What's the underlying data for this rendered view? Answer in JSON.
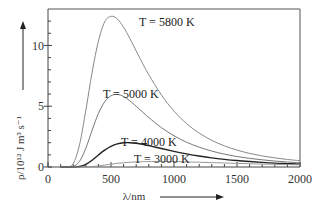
{
  "chart_data": {
    "type": "line",
    "title": "",
    "xlabel": "λ/nm",
    "ylabel": "ρ/10¹² J m³ s⁻¹",
    "xlim": [
      0,
      2000
    ],
    "ylim": [
      0,
      13
    ],
    "x_ticks": [
      0,
      500,
      1000,
      1500,
      2000
    ],
    "y_ticks": [
      0,
      5,
      10
    ],
    "grid": false,
    "legend": "inline labels",
    "x": [
      100,
      150,
      200,
      250,
      300,
      350,
      400,
      450,
      500,
      550,
      600,
      650,
      700,
      750,
      800,
      900,
      1000,
      1100,
      1200,
      1300,
      1400,
      1500,
      1600,
      1700,
      1800,
      1900,
      2000
    ],
    "series": [
      {
        "name": "T = 5800 K",
        "label": "T = 5800 K",
        "color": "#888888",
        "values": [
          0.0,
          0.0,
          0.28,
          1.82,
          4.65,
          7.79,
          10.35,
          11.94,
          12.4,
          12.18,
          11.5,
          10.57,
          9.55,
          8.54,
          7.59,
          5.93,
          4.6,
          3.57,
          2.79,
          2.19,
          1.74,
          1.39,
          1.12,
          0.91,
          0.75,
          0.62,
          0.52
        ]
      },
      {
        "name": "T = 5000 K",
        "label": "T = 5000 K",
        "color": "#777777",
        "values": [
          0.0,
          0.0,
          0.05,
          0.46,
          1.54,
          3.02,
          4.4,
          5.36,
          5.86,
          5.97,
          5.8,
          5.44,
          5.0,
          4.53,
          4.07,
          3.24,
          2.57,
          2.04,
          1.63,
          1.31,
          1.06,
          0.86,
          0.71,
          0.59,
          0.49,
          0.41,
          0.35
        ]
      },
      {
        "name": "T = 4000 K",
        "label": "T = 4000 K",
        "color": "#222222",
        "values": [
          0.0,
          0.0,
          0.0,
          0.04,
          0.21,
          0.56,
          0.99,
          1.39,
          1.7,
          1.9,
          1.99,
          2.0,
          1.95,
          1.87,
          1.76,
          1.52,
          1.29,
          1.08,
          0.9,
          0.75,
          0.63,
          0.53,
          0.45,
          0.38,
          0.32,
          0.28,
          0.24
        ]
      },
      {
        "name": "T = 3000 K",
        "label": "T = 3000 K",
        "color": "#999999",
        "values": [
          0.0,
          0.0,
          0.0,
          0.0,
          0.01,
          0.04,
          0.09,
          0.16,
          0.23,
          0.3,
          0.35,
          0.39,
          0.42,
          0.44,
          0.45,
          0.46,
          0.45,
          0.42,
          0.39,
          0.36,
          0.33,
          0.3,
          0.27,
          0.24,
          0.22,
          0.2,
          0.18
        ]
      }
    ]
  },
  "labels": {
    "x_axis": "λ/nm",
    "y_axis": "ρ/10¹² J m³ s⁻¹",
    "curve_5800": "T = 5800 K",
    "curve_5000": "T = 5000 K",
    "curve_4000": "T = 4000 K",
    "curve_3000": "T = 3000 K",
    "xtick_0": "0",
    "xtick_500": "500",
    "xtick_1000": "1000",
    "xtick_1500": "1500",
    "xtick_2000": "2000",
    "ytick_0": "0",
    "ytick_5": "5",
    "ytick_10": "10"
  }
}
